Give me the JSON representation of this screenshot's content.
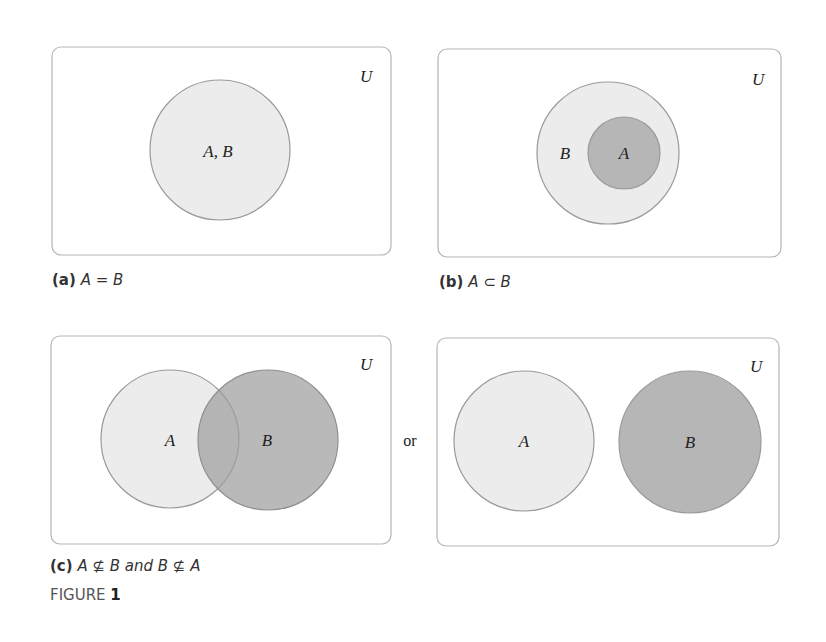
{
  "colors": {
    "frame_stroke": "#b5b5b5",
    "circle_stroke": "#9a9a9a",
    "light_fill": "#ececec",
    "dark_fill": "#b6b6b6",
    "text": "#222222"
  },
  "panels": {
    "a": {
      "universe_label": "U",
      "circle_label": "A, B",
      "caption_tag": "(a)",
      "caption_expr": "A = B"
    },
    "b": {
      "universe_label": "U",
      "outer_label": "B",
      "inner_label": "A",
      "caption_tag": "(b)",
      "caption_expr": "A ⊂ B"
    },
    "c": {
      "universe_label": "U",
      "left_label": "A",
      "right_label": "B",
      "or_text": "or",
      "caption_tag": "(c)",
      "caption_expr": "A ⊈ B and B ⊈ A"
    },
    "d": {
      "universe_label": "U",
      "left_label": "A",
      "right_label": "B"
    }
  },
  "figure": {
    "prefix": "FIGURE",
    "number": "1"
  }
}
